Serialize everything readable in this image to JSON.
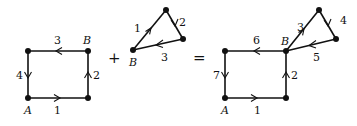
{
  "diagram": {
    "left_square": {
      "edge_labels": [
        "1",
        "2",
        "3",
        "4"
      ],
      "vertex_A": "A",
      "vertex_B": "B"
    },
    "operator_plus": "+",
    "triangle": {
      "edge_labels": [
        "1",
        "2",
        "3"
      ],
      "vertex_B": "B"
    },
    "operator_equals": "=",
    "result": {
      "edge_labels": [
        "1",
        "2",
        "3",
        "4",
        "5",
        "6",
        "7"
      ],
      "vertex_A": "A",
      "vertex_B": "B"
    }
  }
}
